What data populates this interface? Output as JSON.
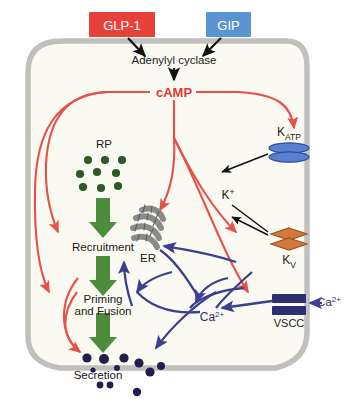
{
  "diagram": {
    "background_color": "#fefefe",
    "cell_fill": "#fbfaf2",
    "membrane_color": "#bdbdbd"
  },
  "ligands": [
    {
      "label": "GLP-1",
      "color": "#e8413a",
      "text_color": "#ffffff"
    },
    {
      "label": "GIP",
      "color": "#5b95d1",
      "text_color": "#ffffff"
    }
  ],
  "enzymes": {
    "adenylyl_cyclase": {
      "label": "Adenylyl cyclase",
      "color": "#1a1a1a"
    },
    "camp": {
      "label": "cAMP",
      "color": "#e03a34"
    }
  },
  "pools": {
    "reserve_pool": {
      "label": "RP",
      "granule_color": "#2d5a27",
      "granule_count": 9,
      "label_color": "#1a1a1a"
    },
    "er": {
      "label": "ER",
      "color": "#8a8a8a",
      "label_color": "#1a1a1a"
    }
  },
  "steps": [
    {
      "label": "Recruitment",
      "color": "#1a1a1a"
    },
    {
      "label": "Priming\nand Fusion",
      "line1": "Priming",
      "line2": "and Fusion",
      "color": "#1a1a1a"
    },
    {
      "label": "Secretion",
      "color": "#1a1a1a"
    }
  ],
  "channels": [
    {
      "name": "KATP",
      "label_main": "K",
      "label_sub": "ATP",
      "color": "#4a6fc4",
      "shape": "stacked-ellipses"
    },
    {
      "name": "KV",
      "label_main": "K",
      "label_sub": "V",
      "color": "#c4622a",
      "shape": "stacked-diamonds"
    },
    {
      "name": "VSCC",
      "label_main": "VSCC",
      "label_sub": "",
      "color": "#2e2f72",
      "shape": "rect-channel"
    }
  ],
  "ions": [
    {
      "label_main": "K",
      "label_sup": "+",
      "color": "#1a1a1a",
      "position": "intracellular"
    },
    {
      "label_main": "Ca",
      "label_sup": "2+",
      "color": "#2e2f72",
      "position": "intracellular"
    },
    {
      "label_main": "Ca",
      "label_sup": "2+",
      "color": "#2e2f72",
      "position": "extracellular"
    }
  ],
  "arrows": {
    "camp_signal_color": "#e8504a",
    "calcium_signal_color": "#3b3f8f",
    "granule_flow_color": "#4d8c3c",
    "ion_flux_color": "#111111"
  },
  "secretion_granules": {
    "color": "#221f4d",
    "count": 11
  }
}
